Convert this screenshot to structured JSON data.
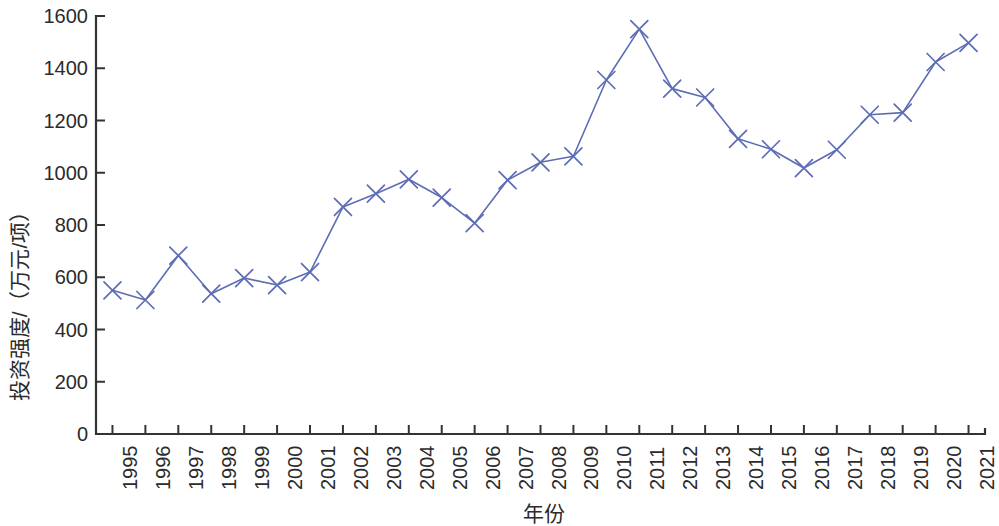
{
  "chart_data": {
    "type": "line",
    "title": "",
    "xlabel": "年份",
    "ylabel": "投资强度/（万元/项）",
    "categories": [
      "1995",
      "1996",
      "1997",
      "1998",
      "1999",
      "2000",
      "2001",
      "2002",
      "2003",
      "2004",
      "2005",
      "2006",
      "2007",
      "2008",
      "2009",
      "2010",
      "2011",
      "2012",
      "2013",
      "2014",
      "2015",
      "2016",
      "2017",
      "2018",
      "2019",
      "2020",
      "2021"
    ],
    "values": [
      550,
      513,
      683,
      537,
      597,
      570,
      620,
      869,
      920,
      975,
      905,
      807,
      972,
      1040,
      1063,
      1355,
      1550,
      1322,
      1288,
      1130,
      1090,
      1018,
      1088,
      1222,
      1230,
      1424,
      1497
    ],
    "series": [
      {
        "name": "投资强度",
        "color": "#5c6cb5",
        "marker": "x",
        "values": [
          550,
          513,
          683,
          537,
          597,
          570,
          620,
          869,
          920,
          975,
          905,
          807,
          972,
          1040,
          1063,
          1355,
          1550,
          1322,
          1288,
          1130,
          1090,
          1018,
          1088,
          1222,
          1230,
          1424,
          1497
        ]
      }
    ],
    "ylim": [
      0,
      1600
    ],
    "yticks": [
      0,
      200,
      400,
      600,
      800,
      1000,
      1200,
      1400,
      1600
    ],
    "ytick_labels": [
      "0",
      "200",
      "400",
      "600",
      "800",
      "1000",
      "1200",
      "1400",
      "1600"
    ],
    "xtick_labels": [
      "1995",
      "1996",
      "1997",
      "1998",
      "1999",
      "2000",
      "2001",
      "2002",
      "2003",
      "2004",
      "2005",
      "2006",
      "2007",
      "2008",
      "2009",
      "2010",
      "2011",
      "2012",
      "2013",
      "2014",
      "2015",
      "2016",
      "2017",
      "2018",
      "2019",
      "2020",
      "2021"
    ],
    "grid": false,
    "legend": null,
    "axis_color": "#333333",
    "background": "#ffffff",
    "xtick_rotation": 90
  },
  "axes": {
    "plot_left": 96,
    "plot_right": 985,
    "plot_top": 16,
    "plot_bottom": 434
  }
}
